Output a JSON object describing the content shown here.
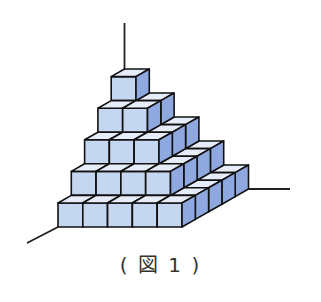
{
  "figure": {
    "caption": "( 図 1 )",
    "layers": [
      {
        "level": 1,
        "columns": 5,
        "rows": 5
      },
      {
        "level": 2,
        "columns": 4,
        "rows": 4
      },
      {
        "level": 3,
        "columns": 3,
        "rows": 3
      },
      {
        "level": 4,
        "columns": 2,
        "rows": 2
      },
      {
        "level": 5,
        "columns": 1,
        "rows": 1
      }
    ],
    "colors": {
      "front_face": "#c5d6f0",
      "top_face": "#e6edf8",
      "side_face": "#8fa9e0",
      "edge": "#111111",
      "axis": "#222222"
    }
  }
}
